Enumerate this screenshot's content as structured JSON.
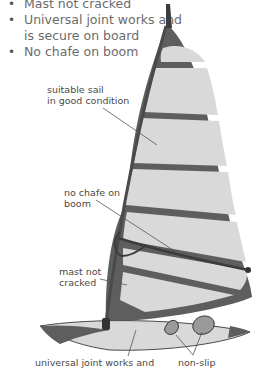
{
  "checklist": {
    "items": [
      "Mast not cracked",
      "Universal joint works and",
      "is secure on board",
      "No chafe on boom"
    ]
  },
  "diagram": {
    "labels": {
      "sail": "suitable sail\nin good condition",
      "boom": "no chafe on\nboom",
      "mast": "mast not\ncracked",
      "joint": "universal joint works and",
      "footstraps": "non-slip"
    },
    "colors": {
      "sail_panel": "#d9d9d9",
      "frame": "#5e5e5e",
      "text": "#6b6b6b",
      "label": "#4a4a4a"
    }
  }
}
